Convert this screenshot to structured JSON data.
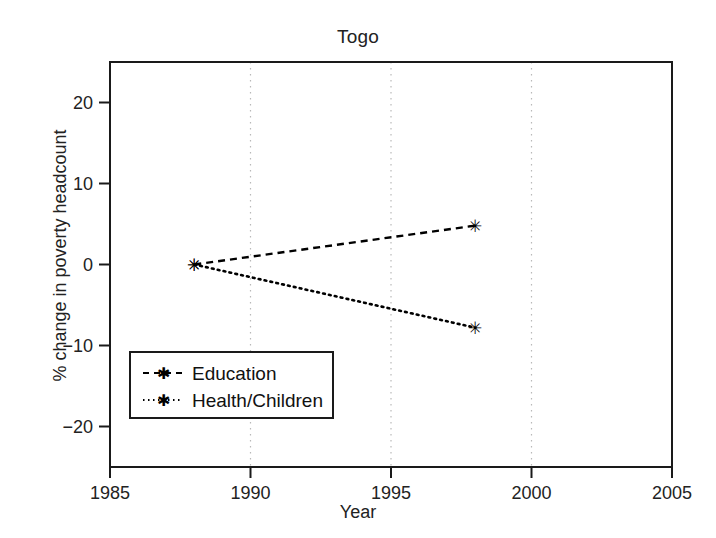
{
  "chart_data": {
    "type": "line",
    "title": "Togo",
    "xlabel": "Year",
    "ylabel": "% change in poverty headcount",
    "xlim": [
      1985,
      2005
    ],
    "ylim": [
      -25,
      25
    ],
    "xticks": [
      1985,
      1990,
      1995,
      2000,
      2005
    ],
    "xtick_labels": [
      "1985",
      "1990",
      "1995",
      "2000",
      "2005"
    ],
    "yticks": [
      20,
      10,
      0,
      -10,
      -20
    ],
    "ytick_labels": [
      "20",
      "10",
      "0",
      "−10",
      "−20"
    ],
    "grid": "vertical-dotted-at-1990-1995-2000",
    "legend_position": "lower-left-inside",
    "series": [
      {
        "name": "Education",
        "linestyle": "dashed",
        "marker": "asterisk",
        "color": "#000000",
        "x": [
          1988,
          1998
        ],
        "values": [
          0.0,
          4.8
        ]
      },
      {
        "name": "Health/Children",
        "linestyle": "dotted",
        "marker": "asterisk",
        "color": "#000000",
        "x": [
          1988,
          1998
        ],
        "values": [
          0.0,
          -7.8
        ]
      }
    ]
  },
  "legend": {
    "items": [
      {
        "label": "Education",
        "style": "dashed"
      },
      {
        "label": "Health/Children",
        "style": "dotted"
      }
    ]
  },
  "colors": {
    "axis": "#1a1a1a",
    "grid": "#b9b9b9",
    "series": "#000000",
    "background": "#ffffff"
  }
}
